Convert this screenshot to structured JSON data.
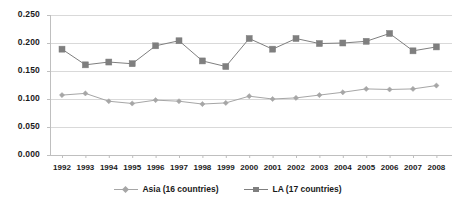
{
  "chart_data": {
    "type": "line",
    "title": "",
    "xlabel": "",
    "ylabel": "",
    "categories": [
      "1992",
      "1993",
      "1994",
      "1995",
      "1996",
      "1997",
      "1998",
      "1999",
      "2000",
      "2001",
      "2002",
      "2003",
      "2004",
      "2005",
      "2006",
      "2007",
      "2008"
    ],
    "x": [
      1992,
      1993,
      1994,
      1995,
      1996,
      1997,
      1998,
      1999,
      2000,
      2001,
      2002,
      2003,
      2004,
      2005,
      2006,
      2007,
      2008
    ],
    "series": [
      {
        "name": "Asia (16 countries)",
        "marker": "diamond",
        "color": "#a6a6a6",
        "values": [
          0.107,
          0.11,
          0.096,
          0.092,
          0.098,
          0.096,
          0.091,
          0.093,
          0.105,
          0.1,
          0.102,
          0.107,
          0.112,
          0.118,
          0.117,
          0.118,
          0.124
        ]
      },
      {
        "name": "LA (17 countries)",
        "marker": "square",
        "color": "#7f7f7f",
        "values": [
          0.189,
          0.161,
          0.166,
          0.163,
          0.195,
          0.204,
          0.168,
          0.158,
          0.208,
          0.189,
          0.208,
          0.199,
          0.2,
          0.203,
          0.217,
          0.186,
          0.193
        ]
      }
    ],
    "ylim": [
      0.0,
      0.25
    ],
    "yticks": [
      0.0,
      0.05,
      0.1,
      0.15,
      0.2,
      0.25
    ],
    "ytick_labels": [
      "0.000",
      "0.050",
      "0.100",
      "0.150",
      "0.200",
      "0.250"
    ],
    "grid": true,
    "grid_axis": "y",
    "legend_position": "bottom",
    "legend_entries": [
      "Asia (16 countries)",
      "LA (17 countries)"
    ],
    "axis_color": "#bfbfbf",
    "grid_color": "#d9d9d9",
    "text_color": "#1a1a1a",
    "background": "#ffffff"
  },
  "layout": {
    "plot_left": 50,
    "plot_right": 452,
    "plot_top": 15,
    "plot_bottom": 155,
    "x_first": 62,
    "x_step": 23.4
  }
}
